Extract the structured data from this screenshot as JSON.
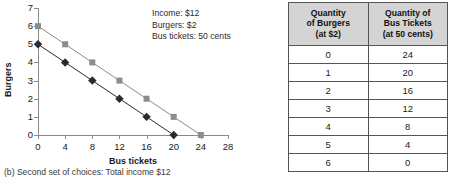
{
  "chart_data": {
    "type": "line",
    "title": "",
    "xlabel": "Bus tickets",
    "ylabel": "Burgers",
    "xlim": [
      0,
      28
    ],
    "ylim": [
      0,
      7
    ],
    "xticks": [
      0,
      4,
      8,
      12,
      16,
      20,
      24,
      28
    ],
    "yticks": [
      0,
      1,
      2,
      3,
      4,
      5,
      6,
      7
    ],
    "grid": false,
    "legend": "none",
    "series": [
      {
        "name": "budget-line-gray-squares",
        "marker": "square",
        "color": "#8c8c8c",
        "x": [
          0,
          4,
          8,
          12,
          16,
          20,
          24
        ],
        "y": [
          6,
          5,
          4,
          3,
          2,
          1,
          0
        ]
      },
      {
        "name": "budget-line-black-diamonds",
        "marker": "diamond",
        "color": "#2b2b2b",
        "x": [
          0,
          4,
          8,
          12,
          16,
          20
        ],
        "y": [
          5,
          4,
          3,
          2,
          1,
          0
        ]
      }
    ],
    "annotations": [
      "Income: $12",
      "Burgers: $2",
      "Bus tickets: 50 cents"
    ]
  },
  "chart": {
    "y_axis_title": "Burgers",
    "x_axis_title": "Bus tickets",
    "annotation_lines": [
      "Income: $12",
      "Burgers: $2",
      "Bus tickets: 50 cents"
    ],
    "caption": "(b) Second set of choices: Total income $12",
    "colors": {
      "axis": "#8a8a8a",
      "series_gray": "#8c8c8c",
      "series_black": "#2b2b2b",
      "text": "#1a1a1a"
    }
  },
  "table": {
    "headers": [
      "Quantity\nof Burgers\n(at $2)",
      "Quantity of\nBus Tickets\n(at 50 cents)"
    ],
    "header_lines": [
      [
        "Quantity",
        "of Burgers",
        "(at $2)"
      ],
      [
        "Quantity of",
        "Bus Tickets",
        "(at 50 cents)"
      ]
    ],
    "rows": [
      [
        "0",
        "24"
      ],
      [
        "1",
        "20"
      ],
      [
        "2",
        "16"
      ],
      [
        "3",
        "12"
      ],
      [
        "4",
        "8"
      ],
      [
        "5",
        "4"
      ],
      [
        "6",
        "0"
      ]
    ],
    "header_bg": "#d4d4d4",
    "border_color": "#555555"
  }
}
